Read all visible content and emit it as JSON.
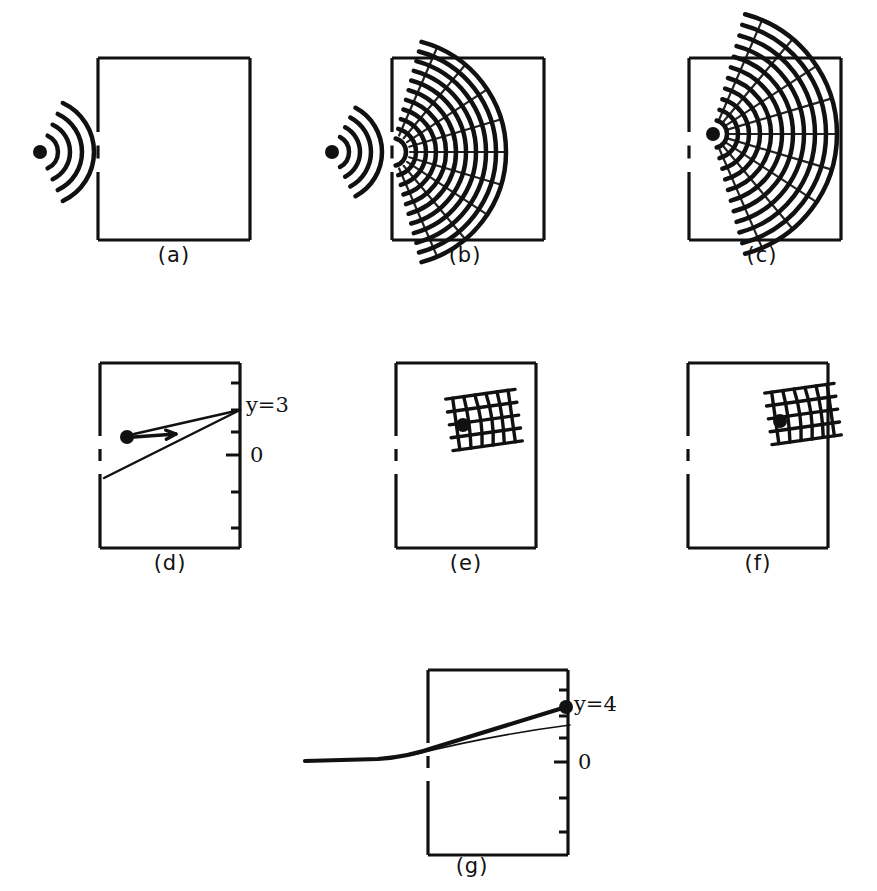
{
  "figure": {
    "background_color": "#ffffff",
    "ink_color": "#111111",
    "width": 877,
    "height": 891,
    "caption_style": "parenthesized-letter"
  },
  "panels": [
    {
      "id": "a",
      "label": "(a)",
      "label_x": 174,
      "label_y": 262,
      "box": {
        "x": 98,
        "y": 58,
        "w": 152,
        "h": 182
      },
      "slit": {
        "center_y": 152,
        "gap": 40,
        "dash_len": 13
      },
      "source": {
        "x": 40,
        "y": 152,
        "r": 7,
        "inside_box": false
      },
      "wave": {
        "kind": "arcs-outside",
        "arc_count": 4,
        "radii": [
          18,
          30,
          42,
          54
        ],
        "span_deg": 130,
        "stroke": 4.5
      },
      "description": "point source outside box emitting concentric wavefronts toward a slit"
    },
    {
      "id": "b",
      "label": "(b)",
      "label_x": 465,
      "label_y": 262,
      "box": {
        "x": 392,
        "y": 58,
        "w": 152,
        "h": 182
      },
      "slit": {
        "center_y": 152,
        "gap": 40,
        "dash_len": 13
      },
      "source": {
        "x": 332,
        "y": 152,
        "r": 7,
        "inside_box": false
      },
      "wave": {
        "kind": "arcs-outside-and-diffracted",
        "outer_arc_count": 4,
        "outer_radii": [
          17,
          28,
          39,
          50
        ],
        "inner_arc_count": 11,
        "inner_r_start": 14,
        "inner_r_step": 10,
        "span_deg": 150,
        "stroke": 4.5
      },
      "description": "wavefronts passing through slit and spreading as a fan inside the box"
    },
    {
      "id": "c",
      "label": "(c)",
      "label_x": 762,
      "label_y": 262,
      "box": {
        "x": 689,
        "y": 58,
        "w": 152,
        "h": 182
      },
      "slit": {
        "center_y": 152,
        "gap": 40,
        "dash_len": 13
      },
      "source": {
        "x": 713,
        "y": 134,
        "r": 7,
        "inside_box": true
      },
      "wave": {
        "kind": "arcs-inside",
        "arc_count": 11,
        "r_start": 14,
        "r_step": 11,
        "span_deg": 150,
        "stroke": 4.5
      },
      "description": "diffracted wave fan fully inside the box, source point marked"
    },
    {
      "id": "d",
      "label": "(d)",
      "label_x": 170,
      "label_y": 570,
      "box": {
        "x": 100,
        "y": 363,
        "w": 140,
        "h": 185
      },
      "slit": {
        "center_y": 455,
        "gap": 38,
        "dash_len": 12
      },
      "source": {
        "x": 127,
        "y": 437,
        "r": 7,
        "inside_box": true
      },
      "arrow": {
        "x1": 134,
        "y1": 437,
        "x2": 176,
        "y2": 434
      },
      "rays": [
        {
          "from_x": 134,
          "from_y": 434,
          "to_x": 240,
          "to_y": 410
        },
        {
          "from_x": 104,
          "from_y": 478,
          "to_x": 240,
          "to_y": 410
        }
      ],
      "axis": {
        "side": "right",
        "ticks_y": [
          383,
          410,
          432,
          455,
          492,
          528
        ],
        "tick_len_short": 9,
        "tick_len_long": 14,
        "zero_tick_y": 455,
        "labels": [
          {
            "text": "y=3",
            "x": 246,
            "y": 412
          },
          {
            "text": "0",
            "x": 250,
            "y": 462
          }
        ]
      },
      "description": "particle with rightward velocity arrow; two rays converge at y=3 on the right wall"
    },
    {
      "id": "e",
      "label": "(e)",
      "label_x": 466,
      "label_y": 570,
      "box": {
        "x": 396,
        "y": 363,
        "w": 140,
        "h": 185
      },
      "slit": {
        "center_y": 455,
        "gap": 38,
        "dash_len": 12
      },
      "source": {
        "x": 463,
        "y": 425,
        "r": 7,
        "inside_box": true
      },
      "packet": {
        "kind": "grid-packet",
        "center_x": 484,
        "center_y": 420,
        "half_w": 28,
        "half_h": 26,
        "vertical_count": 6,
        "horizontal_count": 5,
        "tilt_deg": -8,
        "stroke": 3.4
      },
      "description": "localized wave packet (crossed fringes) in the upper middle of the box"
    },
    {
      "id": "f",
      "label": "(f)",
      "label_x": 758,
      "label_y": 570,
      "box": {
        "x": 688,
        "y": 363,
        "w": 140,
        "h": 185
      },
      "slit": {
        "center_y": 455,
        "gap": 38,
        "dash_len": 12
      },
      "source": {
        "x": 780,
        "y": 421,
        "r": 7,
        "inside_box": true
      },
      "packet": {
        "kind": "grid-packet",
        "center_x": 803,
        "center_y": 414,
        "half_w": 28,
        "half_h": 26,
        "vertical_count": 6,
        "horizontal_count": 5,
        "tilt_deg": -8,
        "stroke": 3.4
      },
      "description": "wave packet arrived at the right wall of the box"
    },
    {
      "id": "g",
      "label": "(g)",
      "label_x": 472,
      "label_y": 873,
      "box": {
        "x": 428,
        "y": 670,
        "w": 140,
        "h": 185
      },
      "slit": {
        "center_y": 762,
        "gap": 38,
        "dash_len": 12
      },
      "source": {
        "x": 566,
        "y": 707,
        "r": 7,
        "inside_box": true
      },
      "trajectory": {
        "entry_x": 305,
        "entry_y": 761,
        "bend_x": 418,
        "bend_y": 757,
        "end_x": 566,
        "end_y": 707,
        "stroke_thick": 4.2,
        "stroke_thin": 1.6
      },
      "axis": {
        "side": "right",
        "ticks_y": [
          690,
          716,
          738,
          762,
          798,
          832
        ],
        "tick_len_short": 9,
        "tick_len_long": 14,
        "zero_tick_y": 762,
        "labels": [
          {
            "text": "y=4",
            "x": 574,
            "y": 711
          },
          {
            "text": "0",
            "x": 578,
            "y": 769
          }
        ]
      },
      "description": "trajectory entering from outside, bending at the slit and ending at y=4 on the right wall"
    }
  ],
  "text_items": {
    "panel_labels": [
      "(a)",
      "(b)",
      "(c)",
      "(d)",
      "(e)",
      "(f)",
      "(g)"
    ],
    "axis_annotations": [
      "y=3",
      "0",
      "y=4",
      "0"
    ]
  }
}
